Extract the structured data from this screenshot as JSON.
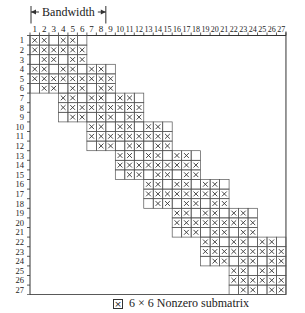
{
  "figure": {
    "bandwidth_label": "Bandwidth",
    "rows": 27,
    "cols": 27,
    "block_size": 3,
    "cell_marker": "×",
    "row_patterns": [
      [
        true,
        true,
        false
      ],
      [
        true,
        true,
        true
      ],
      [
        false,
        true,
        true
      ]
    ],
    "group_spans": [
      {
        "rows": "1-3",
        "cols": "1-9"
      },
      {
        "rows": "4-6",
        "cols": "1-12"
      },
      {
        "rows": "7-9",
        "cols": "1-15"
      },
      {
        "rows": "10-12",
        "cols": "4-18"
      },
      {
        "rows": "13-15",
        "cols": "7-21"
      },
      {
        "rows": "16-18",
        "cols": "10-24"
      },
      {
        "rows": "19-21",
        "cols": "13-27"
      },
      {
        "rows": "22-24",
        "cols": "16-27"
      },
      {
        "rows": "25-27",
        "cols": "19-27"
      }
    ]
  },
  "legend": {
    "icon": "crossed-box-icon",
    "text": "6 × 6 Nonzero submatrix"
  }
}
